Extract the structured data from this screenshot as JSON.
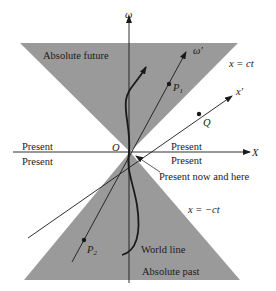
{
  "diagram": {
    "colors": {
      "cone_fill": "#9a9a9a",
      "line": "#1a1a1a",
      "background": "#ffffff"
    },
    "axes": {
      "time_axis_label": "ω",
      "time_prime_label": "ω′",
      "space_axis_label": "X",
      "space_prime_label": "x′",
      "origin_label": "O"
    },
    "regions": {
      "future": "Absolute future",
      "past": "Absolute past",
      "present_upper_left": "Present",
      "present_lower_left": "Present",
      "present_upper_right": "Present",
      "present_lower_right": "Present",
      "here_now": "Present now and here"
    },
    "lines": {
      "light_line_future": "x = ct",
      "light_line_past": "x = −ct",
      "world_line": "World line"
    },
    "points": {
      "p1": {
        "letter": "P",
        "sub": "1"
      },
      "p2": {
        "letter": "P",
        "sub": "2"
      },
      "q": "Q"
    }
  }
}
